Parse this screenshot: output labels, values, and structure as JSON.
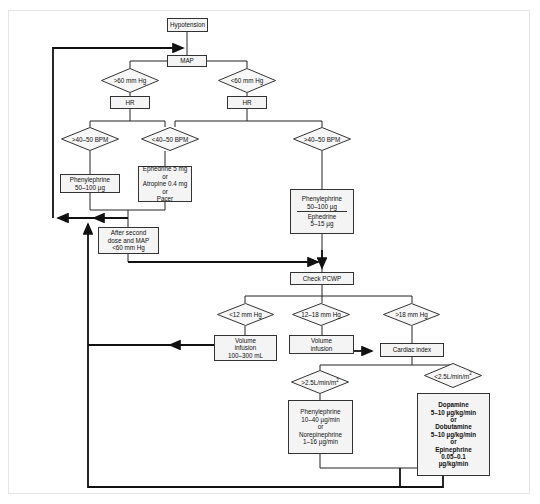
{
  "flowchart": {
    "start": "Hypotension",
    "map": "MAP",
    "map_high": ">60 mm Hg",
    "map_low": "<60 mm Hg",
    "hr_left": "HR",
    "hr_right": "HR",
    "hr_left_high": ">40–50 BPM",
    "hr_left_low": "<40–50 BPM",
    "hr_right_high": ">40–50 BPM",
    "phenyl_left": [
      "Phenylephrine",
      "50–100 µg"
    ],
    "ephedrine_box": [
      "Ephedrine 5 mg",
      "or",
      "Atropine 0.4 mg",
      "or",
      "Pacer"
    ],
    "phenyl_ephed": [
      "Phenylephrine",
      "50–100 µg",
      "Ephedrine",
      "5–15 µg"
    ],
    "after_second": [
      "After second",
      "dose and MAP",
      "<60 mm Hg"
    ],
    "check_pcwp": "Check PCWP",
    "pcwp_low": "<12 mm Hg",
    "pcwp_mid": "12–18 mm Hg",
    "pcwp_high": ">18 mm Hg",
    "volume_low": [
      "Volume",
      "infusion",
      "100–300 mL"
    ],
    "volume_mid": [
      "Volume",
      "infusion"
    ],
    "cardiac_index": "Cardiac index",
    "ci_high": ">2.5L/min/m",
    "ci_low": "<2.5L/min/m",
    "ci_sup": "2",
    "pressors": [
      "Phenylephrine",
      "10–40 µg/min",
      "or",
      "Norepinephrine",
      "1–16 µg/min"
    ],
    "inotropes": [
      "Dopamine",
      "5–10 µg/kg/min",
      "or",
      "Dobutamine",
      "5–10 µg/kg/min",
      "or",
      "Epinephrine",
      "0.05–0.1",
      "µg/kg/min"
    ]
  }
}
